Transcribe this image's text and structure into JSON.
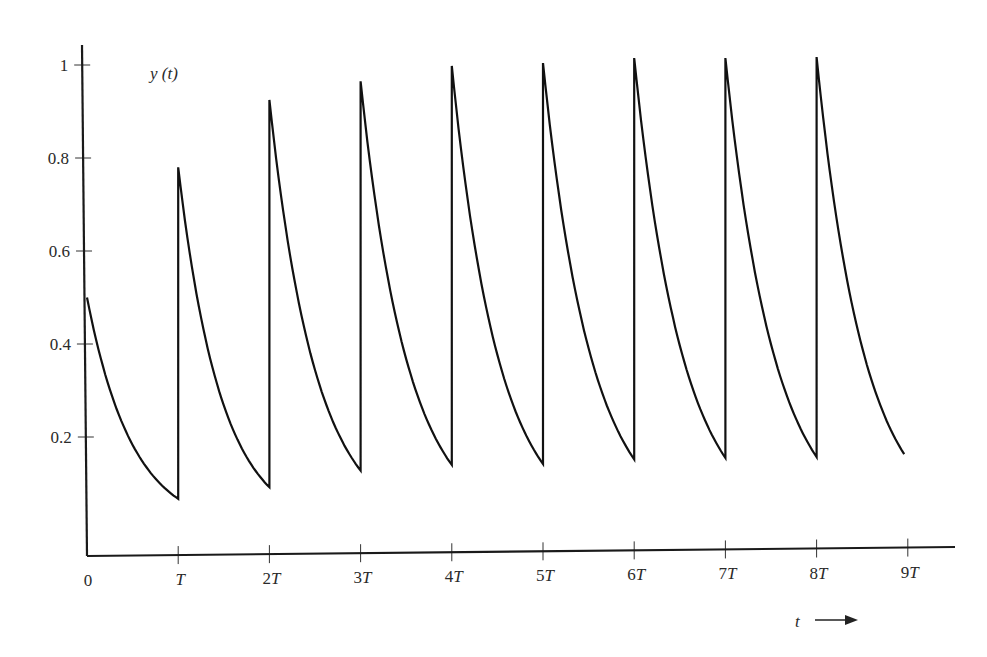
{
  "chart_data": {
    "type": "line",
    "title": "",
    "ylabel": "y (t)",
    "xlabel": "t →",
    "xlabel_arrow": "⟶",
    "ylim": [
      0,
      1.05
    ],
    "xlim": [
      0,
      9.4
    ],
    "grid": false,
    "legend": null,
    "y_ticks": [
      {
        "value": 0.2,
        "label": "0.2"
      },
      {
        "value": 0.4,
        "label": "0.4"
      },
      {
        "value": 0.6,
        "label": "0.6"
      },
      {
        "value": 0.8,
        "label": "0.8"
      },
      {
        "value": 1.0,
        "label": "1"
      }
    ],
    "x_ticks": [
      {
        "value": 0,
        "label": "0"
      },
      {
        "value": 1,
        "label": "T"
      },
      {
        "value": 2,
        "label": "2T"
      },
      {
        "value": 3,
        "label": "3T"
      },
      {
        "value": 4,
        "label": "4T"
      },
      {
        "value": 5,
        "label": "5T"
      },
      {
        "value": 6,
        "label": "6T"
      },
      {
        "value": 7,
        "label": "7T"
      },
      {
        "value": 8,
        "label": "8T"
      },
      {
        "value": 9,
        "label": "9T"
      }
    ],
    "series": [
      {
        "name": "y(t)",
        "description": "Periodically impulse-driven exponential decay: jumps up at each multiple of T, decays exponentially between.",
        "segments": [
          {
            "t_start": 0,
            "y_start": 0.5,
            "t_end": 1,
            "y_end": 0.067
          },
          {
            "t_start": 1,
            "y_start": 0.78,
            "t_end": 2,
            "y_end": 0.092
          },
          {
            "t_start": 2,
            "y_start": 0.925,
            "t_end": 3,
            "y_end": 0.128
          },
          {
            "t_start": 3,
            "y_start": 0.965,
            "t_end": 4,
            "y_end": 0.14
          },
          {
            "t_start": 4,
            "y_start": 0.998,
            "t_end": 5,
            "y_end": 0.142
          },
          {
            "t_start": 5,
            "y_start": 1.004,
            "t_end": 6,
            "y_end": 0.152
          },
          {
            "t_start": 6,
            "y_start": 1.015,
            "t_end": 7,
            "y_end": 0.155
          },
          {
            "t_start": 7,
            "y_start": 1.015,
            "t_end": 8,
            "y_end": 0.157
          },
          {
            "t_start": 8,
            "y_start": 1.017,
            "t_end": 8.96,
            "y_end": 0.163
          }
        ],
        "peaks": [
          0.78,
          0.925,
          0.965,
          0.998,
          1.004,
          1.015,
          1.015,
          1.017
        ],
        "troughs": [
          0.067,
          0.092,
          0.128,
          0.14,
          0.142,
          0.152,
          0.155,
          0.157
        ]
      }
    ]
  },
  "axis_labels": {
    "y": "y (t)",
    "t": "t",
    "arrow": "⟶"
  }
}
